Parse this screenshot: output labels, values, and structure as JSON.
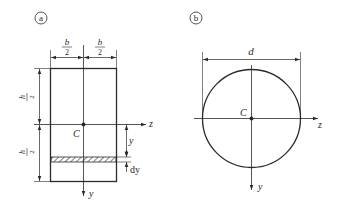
{
  "figures": [
    {
      "id": "a",
      "tag": "a",
      "shape": "rectangle",
      "labels": {
        "width_half_num": "b",
        "width_half_den": "2",
        "height_half_num": "h",
        "height_half_den": "2",
        "centroid": "C",
        "z_axis": "z",
        "y_axis": "y",
        "y_dim": "y",
        "dy_dim": "dy"
      }
    },
    {
      "id": "b",
      "tag": "b",
      "shape": "circle",
      "labels": {
        "diameter": "d",
        "centroid": "C",
        "z_axis": "z",
        "y_axis": "y"
      }
    }
  ]
}
